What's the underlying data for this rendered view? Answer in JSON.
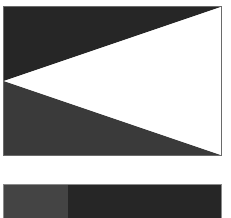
{
  "figure": {
    "flag": {
      "top_color": "#262626",
      "bottom_color": "#3a3a3a",
      "triangle_color": "#ffffff",
      "border_color": "#6a6a6a"
    },
    "bar": {
      "left_color": "#444444",
      "right_color": "#262626"
    }
  }
}
